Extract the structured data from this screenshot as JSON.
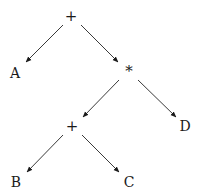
{
  "diagram": {
    "type": "expression-tree",
    "nodes": [
      {
        "id": "root",
        "label": "+",
        "kind": "operator"
      },
      {
        "id": "A",
        "label": "A",
        "kind": "operand"
      },
      {
        "id": "mul",
        "label": "*",
        "kind": "operator"
      },
      {
        "id": "plus2",
        "label": "+",
        "kind": "operator"
      },
      {
        "id": "D",
        "label": "D",
        "kind": "operand"
      },
      {
        "id": "B",
        "label": "B",
        "kind": "operand"
      },
      {
        "id": "C",
        "label": "C",
        "kind": "operand"
      }
    ],
    "edges": [
      {
        "from": "root",
        "to": "A"
      },
      {
        "from": "root",
        "to": "mul"
      },
      {
        "from": "mul",
        "to": "plus2"
      },
      {
        "from": "mul",
        "to": "D"
      },
      {
        "from": "plus2",
        "to": "B"
      },
      {
        "from": "plus2",
        "to": "C"
      }
    ],
    "edge_style": "directed-arrow"
  }
}
